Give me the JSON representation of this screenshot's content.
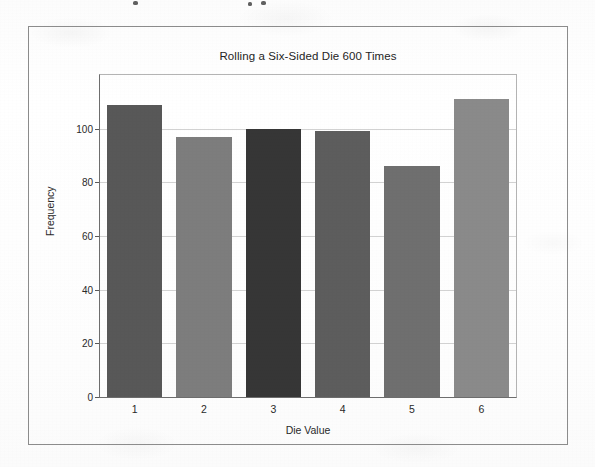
{
  "figure": {
    "frame_color": "#8c8c8c",
    "background_color": "#fdfdfd"
  },
  "chart_data": {
    "type": "bar",
    "title": "Rolling a Six-Sided Die 600 Times",
    "xlabel": "Die Value",
    "ylabel": "Frequency",
    "categories": [
      "1",
      "2",
      "3",
      "4",
      "5",
      "6"
    ],
    "values": [
      109,
      97,
      100,
      99,
      86,
      111
    ],
    "bar_colors": [
      "#585858",
      "#7d7d7d",
      "#363636",
      "#5d5d5d",
      "#6f6f6f",
      "#8a8a8a"
    ],
    "xlim": [
      0.5,
      6.5
    ],
    "ylim": [
      0,
      120
    ],
    "yticks": [
      0,
      20,
      40,
      60,
      80,
      100
    ],
    "ytick_labels": [
      "0",
      "20",
      "40",
      "60",
      "80",
      "100"
    ],
    "xtick_labels": [
      "1",
      "2",
      "3",
      "4",
      "5",
      "6"
    ],
    "grid": true,
    "grid_axis": "y",
    "grid_color": "#d2d2d2",
    "legend": null,
    "total_rolls": 600
  }
}
